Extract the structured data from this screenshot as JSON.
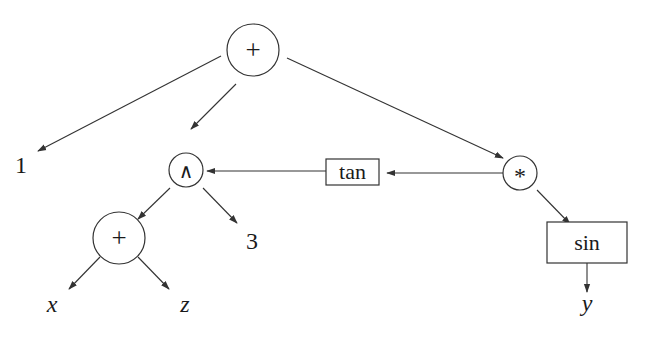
{
  "diagram": {
    "type": "expression-tree",
    "nodes": {
      "root_plus": {
        "label": "+",
        "shape": "circle"
      },
      "one": {
        "label": "1",
        "shape": "text"
      },
      "pow": {
        "label": "∧",
        "shape": "circle"
      },
      "times": {
        "label": "*",
        "shape": "circle"
      },
      "tan": {
        "label": "tan",
        "shape": "box"
      },
      "three": {
        "label": "3",
        "shape": "text"
      },
      "inner_plus": {
        "label": "+",
        "shape": "circle"
      },
      "x": {
        "label": "x",
        "shape": "text"
      },
      "z": {
        "label": "z",
        "shape": "text"
      },
      "sin": {
        "label": "sin",
        "shape": "box"
      },
      "y": {
        "label": "y",
        "shape": "text"
      }
    },
    "edges": [
      {
        "from": "root_plus",
        "to": "one"
      },
      {
        "from": "root_plus",
        "to": "pow"
      },
      {
        "from": "root_plus",
        "to": "times"
      },
      {
        "from": "times",
        "to": "tan"
      },
      {
        "from": "tan",
        "to": "pow"
      },
      {
        "from": "pow",
        "to": "inner_plus"
      },
      {
        "from": "pow",
        "to": "three"
      },
      {
        "from": "inner_plus",
        "to": "x"
      },
      {
        "from": "inner_plus",
        "to": "z"
      },
      {
        "from": "times",
        "to": "sin"
      },
      {
        "from": "sin",
        "to": "y"
      }
    ],
    "colors": {
      "stroke": "#333333",
      "text": "#1a1a1a",
      "background": "#ffffff"
    }
  }
}
